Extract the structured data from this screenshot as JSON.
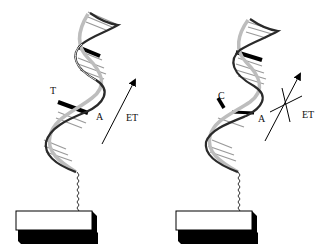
{
  "figure": {
    "panels": [
      {
        "id": "left",
        "base_pair_labels": {
          "left": "T",
          "right": "A"
        },
        "arrow_label": "ET",
        "et_blocked": false
      },
      {
        "id": "right",
        "base_pair_labels": {
          "left": "C",
          "right": "A"
        },
        "arrow_label": "ET",
        "et_blocked": true
      }
    ],
    "colors": {
      "strand_dark": "#2a2a2a",
      "strand_light": "#bdbdbd",
      "rung": "#9a9a9a",
      "highlight_pair": "#000000",
      "surface_fill": "#ffffff",
      "surface_shadow": "#000000"
    }
  }
}
